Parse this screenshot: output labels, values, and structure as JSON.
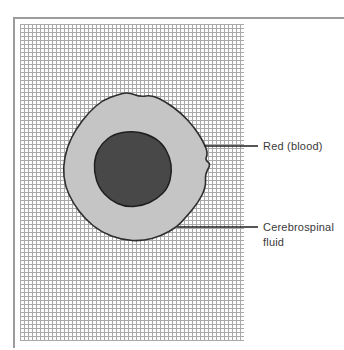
{
  "figure": {
    "background": "#ffffff",
    "frame_color": "#9c9c9c"
  },
  "grid": {
    "name": "graph-paper",
    "line_color": "#a9a9a9",
    "cell_px": 4
  },
  "diagram": {
    "labels": {
      "red_blood": {
        "text": "Red (blood)"
      },
      "csf": {
        "line1": "Cerebrospinal",
        "line2": "fluid",
        "full": "Cerebrospinal fluid"
      }
    },
    "shapes": {
      "outer": {
        "meaning": "cerebrospinal fluid region",
        "fill": "#c5c5c5",
        "stroke": "#2e2e2e",
        "stroke_width": 1.6,
        "points": [
          [
            117,
            95
          ],
          [
            128,
            92
          ],
          [
            140,
            97
          ],
          [
            152,
            95
          ],
          [
            166,
            102
          ],
          [
            181,
            113
          ],
          [
            194,
            127
          ],
          [
            203,
            141
          ],
          [
            208,
            153
          ],
          [
            205,
            160
          ],
          [
            211,
            164
          ],
          [
            205,
            174
          ],
          [
            206,
            187
          ],
          [
            198,
            203
          ],
          [
            186,
            217
          ],
          [
            177,
            227
          ],
          [
            161,
            236
          ],
          [
            143,
            241
          ],
          [
            122,
            240
          ],
          [
            101,
            232
          ],
          [
            85,
            219
          ],
          [
            73,
            203
          ],
          [
            65,
            186
          ],
          [
            63,
            167
          ],
          [
            67,
            147
          ],
          [
            76,
            129
          ],
          [
            89,
            112
          ],
          [
            103,
            100
          ]
        ]
      },
      "inner": {
        "meaning": "red blood region",
        "fill": "#484848",
        "stroke": "#1f1f1f",
        "stroke_width": 1.5,
        "points": [
          [
            131,
            131
          ],
          [
            148,
            134
          ],
          [
            162,
            143
          ],
          [
            170,
            157
          ],
          [
            172,
            172
          ],
          [
            168,
            188
          ],
          [
            157,
            199
          ],
          [
            142,
            206
          ],
          [
            125,
            207
          ],
          [
            110,
            200
          ],
          [
            99,
            188
          ],
          [
            94,
            172
          ],
          [
            95,
            156
          ],
          [
            102,
            143
          ],
          [
            114,
            134
          ]
        ]
      }
    },
    "leaders": {
      "color": "#1f1f1f",
      "width": 1.5,
      "red_blood": {
        "x1": 204,
        "y1": 146,
        "x2": 258,
        "y2": 146
      },
      "csf": {
        "x1": 177,
        "y1": 227,
        "x2": 258,
        "y2": 227
      }
    }
  }
}
